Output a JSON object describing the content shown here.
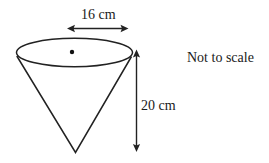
{
  "figure": {
    "shape": "cone",
    "orientation": "apex-down",
    "stroke_color": "#222222",
    "background_color": "#ffffff",
    "labels": {
      "diameter": "16 cm",
      "height": "20 cm",
      "note": "Not to scale"
    },
    "dimensions": {
      "diameter_value": 16,
      "diameter_unit": "cm",
      "height_value": 20,
      "height_unit": "cm"
    },
    "annotations": {
      "center_dot": "center point of circular top face",
      "diameter_arrow": "double-headed horizontal arrow spanning the top face",
      "height_arrow": "double-headed vertical arrow from rim to apex"
    }
  }
}
